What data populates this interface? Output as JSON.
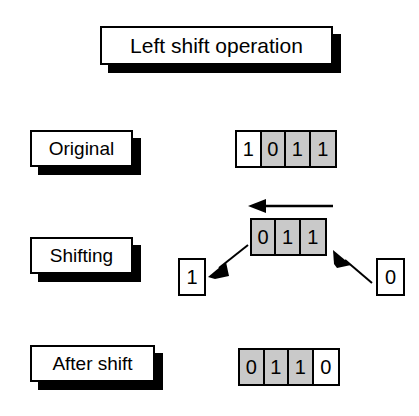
{
  "title": {
    "text": "Left shift operation"
  },
  "rows": [
    {
      "label": "Original",
      "bits": [
        {
          "value": "1",
          "shaded": false
        },
        {
          "value": "0",
          "shaded": true
        },
        {
          "value": "1",
          "shaded": true
        },
        {
          "value": "1",
          "shaded": true
        }
      ]
    },
    {
      "label": "Shifting",
      "bits": [
        {
          "value": "0",
          "shaded": true
        },
        {
          "value": "1",
          "shaded": true
        },
        {
          "value": "1",
          "shaded": true
        }
      ],
      "shifted_out_bit": "1",
      "shifted_in_bit": "0"
    },
    {
      "label": "After shift",
      "bits": [
        {
          "value": "0",
          "shaded": true
        },
        {
          "value": "1",
          "shaded": true
        },
        {
          "value": "1",
          "shaded": true
        },
        {
          "value": "0",
          "shaded": false
        }
      ]
    }
  ],
  "colors": {
    "shaded_cell": "#c9c9c9",
    "line": "#000000",
    "background": "#ffffff",
    "shadow": "#000000"
  }
}
